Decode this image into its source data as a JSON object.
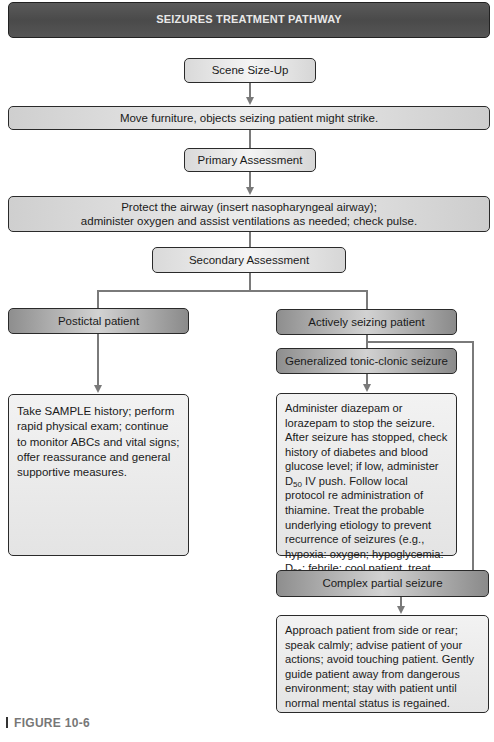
{
  "title": "SEIZURES TREATMENT PATHWAY",
  "steps": {
    "scene_size_up": "Scene Size-Up",
    "move_furniture": "Move furniture, objects seizing patient might strike.",
    "primary_assessment": "Primary Assessment",
    "protect_airway_line1": "Protect the airway (insert nasopharyngeal airway);",
    "protect_airway_line2": "administer oxygen and assist ventilations as needed; check pulse.",
    "secondary_assessment": "Secondary Assessment"
  },
  "branches": {
    "postictal": {
      "label": "Postictal patient",
      "text": "Take SAMPLE history; perform rapid physical exam; continue to monitor ABCs and vital signs; offer reassurance and general supportive measures."
    },
    "actively_seizing": {
      "label": "Actively seizing patient",
      "generalized": {
        "label": "Generalized tonic-clonic seizure",
        "text_part1": "Administer diazepam or lorazepam to stop the seizure. After seizure has stopped, check history of diabetes and blood glucose level; if low, administer D",
        "sub1": "50",
        "text_part2": " IV push. Follow local protocol re administration of thiamine. Treat the probable underlying etiology to prevent recurrence of seizures (e.g., hypoxia: oxygen; hypoglycemia: D",
        "sub2": "50",
        "text_part3": "; febrile: cool patient, treat source of infection)."
      },
      "complex_partial": {
        "label": "Complex partial seizure",
        "text": "Approach patient from side or rear; speak calmly; advise patient of your actions; avoid touching patient. Gently guide patient away from dangerous environment; stay with patient until normal mental status is regained."
      }
    }
  },
  "figure_label": "FIGURE 10-6"
}
